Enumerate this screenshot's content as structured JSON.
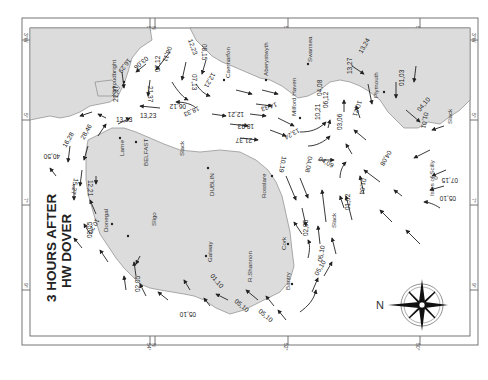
{
  "map": {
    "title_line1": "3 HOURS AFTER",
    "title_line2": "HW DOVER",
    "orientation": "rotated 90° — north points left",
    "compass": {
      "north_label": "N"
    },
    "colors": {
      "land": "#dcdcdc",
      "sea": "#ffffff",
      "coast": "#8a8a8a",
      "arrow": "#222222"
    },
    "frame_ticks": {
      "top": [
        "3°W",
        "54°",
        "N",
        "52°",
        "50°"
      ],
      "bottom": [
        "54°",
        "N",
        "52°",
        "50°"
      ],
      "left": [
        "3°W",
        "5°",
        "7°",
        "9°"
      ],
      "right": [
        "3°W",
        "5°",
        "7°",
        "9°"
      ]
    },
    "places": {
      "kirkcudbright": "Kirkcudbright",
      "caernarfon": "Caernarfon",
      "aberystwyth": "Aberystwyth",
      "swansea": "Swansea",
      "milford_haven": "Milford Haven",
      "plymouth": "Plymouth",
      "larne": "Larne",
      "belfast": "BELFAST",
      "dublin": "DUBLIN",
      "rosslare": "Rosslare",
      "donegal": "Donegal",
      "sligo": "Sligo",
      "galway": "Galway",
      "shannon": "R.Shannon",
      "cork": "Cork",
      "bantry": "Bantry",
      "scilly": "Isles of Scilly"
    },
    "slack_labels": [
      "Slack",
      "Slack",
      "Slack"
    ],
    "rates": [
      "16,29",
      "03,06",
      "06,11",
      "12,23",
      "08,15",
      "07,12",
      "21,37",
      "12,21",
      "07,13",
      "21,37",
      "13,23",
      "13,23",
      "06,12",
      "18,33",
      "12,21",
      "18,33",
      "14,33",
      "21,37",
      "13,24",
      "10,19",
      "04,08",
      "03,06",
      "04,09",
      "10,21",
      "06,12",
      "04,08",
      "13,27",
      "10,21",
      "13,24",
      "01,03",
      "04,10",
      "01,01",
      "04,08",
      "07,15",
      "05,10",
      "01,02",
      "01,04",
      "02,05",
      "05,10",
      "16,28",
      "28,46",
      "40,50",
      "15,27",
      "12,21",
      "02,05",
      "10,20",
      "02,05",
      "01,10",
      "05,10",
      "05,10",
      "05,10",
      "05,10"
    ]
  }
}
